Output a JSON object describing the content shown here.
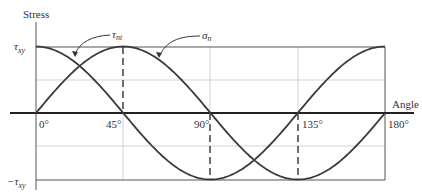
{
  "chart_data": {
    "type": "line",
    "title": "",
    "xlabel": "Angle",
    "ylabel": "Stress",
    "x_ticks": [
      "0°",
      "45°",
      "90°",
      "135°",
      "180°"
    ],
    "y_ticks": [
      "τxy",
      "−τxy"
    ],
    "xlim": [
      0,
      180
    ],
    "ylim": [
      -1,
      1
    ],
    "grid": true,
    "x": [
      0,
      22.5,
      45,
      67.5,
      90,
      112.5,
      135,
      157.5,
      180
    ],
    "series": [
      {
        "name": "σn",
        "label_main": "σ",
        "label_sub": "n",
        "formula": "τxy·cos(2θ)",
        "values": [
          1,
          0.707,
          0,
          -0.707,
          -1,
          -0.707,
          0,
          0.707,
          1
        ]
      },
      {
        "name": "τnt",
        "label_main": "τ",
        "label_sub": "nt",
        "formula": "τxy·sin(2θ)",
        "values": [
          0,
          0.707,
          1,
          0.707,
          0,
          -0.707,
          -1,
          -0.707,
          0
        ]
      }
    ],
    "annotations": [
      "τnt",
      "σn"
    ],
    "dashed_markers": [
      {
        "at_deg": 45,
        "from": "τxy",
        "to": 0
      },
      {
        "at_deg": 90,
        "from": 0,
        "to": "−τxy"
      },
      {
        "at_deg": 135,
        "from": 0,
        "to": "−τxy"
      }
    ]
  },
  "labels": {
    "y_axis": "Stress",
    "x_axis": "Angle",
    "y_top_main": "τ",
    "y_top_sub": "xy",
    "y_bottom_main": "−τ",
    "y_bottom_sub": "xy",
    "tick0": "0°",
    "tick45": "45°",
    "tick90": "90°",
    "tick135": "135°",
    "tick180": "180°",
    "tau_main": "τ",
    "tau_sub": "nt",
    "sigma_main": "σ",
    "sigma_sub": "n"
  }
}
